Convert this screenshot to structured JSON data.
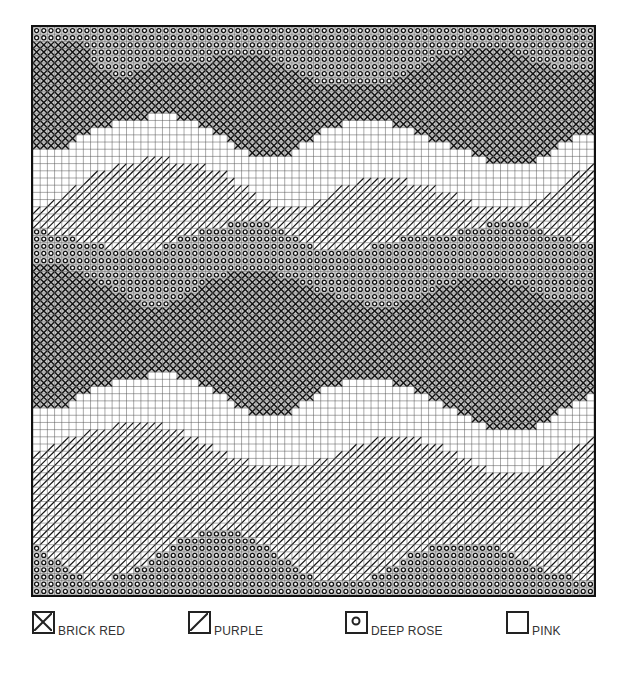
{
  "chart": {
    "cols": 78,
    "rows": 79,
    "symbols": {
      "brick_red": "cross",
      "purple": "slash",
      "deep_rose": "circle",
      "pink": "blank"
    },
    "bands": [
      {
        "color": "deep_rose",
        "from": "top"
      },
      {
        "color": "brick_red",
        "boundary": [
          [
            0,
            2
          ],
          [
            6,
            2
          ],
          [
            9,
            6
          ],
          [
            13,
            7
          ],
          [
            16,
            5
          ],
          [
            22,
            5
          ],
          [
            26,
            4
          ],
          [
            32,
            4
          ],
          [
            36,
            6
          ],
          [
            40,
            8
          ],
          [
            48,
            8
          ],
          [
            52,
            6
          ],
          [
            56,
            4
          ],
          [
            62,
            3
          ],
          [
            66,
            3
          ],
          [
            70,
            5
          ],
          [
            74,
            6
          ],
          [
            77,
            6
          ]
        ]
      },
      {
        "color": "pink",
        "boundary": [
          [
            0,
            17
          ],
          [
            4,
            17
          ],
          [
            6,
            15
          ],
          [
            9,
            14
          ],
          [
            12,
            13
          ],
          [
            18,
            12
          ],
          [
            22,
            13
          ],
          [
            26,
            15
          ],
          [
            30,
            18
          ],
          [
            34,
            18
          ],
          [
            36,
            17
          ],
          [
            40,
            14
          ],
          [
            44,
            13
          ],
          [
            48,
            13
          ],
          [
            52,
            14
          ],
          [
            56,
            16
          ],
          [
            60,
            17
          ],
          [
            64,
            19
          ],
          [
            68,
            19
          ],
          [
            72,
            17
          ],
          [
            75,
            15
          ],
          [
            77,
            15
          ]
        ]
      },
      {
        "color": "purple",
        "boundary": [
          [
            0,
            25
          ],
          [
            4,
            23
          ],
          [
            8,
            20
          ],
          [
            12,
            19
          ],
          [
            16,
            18
          ],
          [
            22,
            19
          ],
          [
            26,
            20
          ],
          [
            30,
            23
          ],
          [
            34,
            25
          ],
          [
            38,
            25
          ],
          [
            42,
            22
          ],
          [
            46,
            21
          ],
          [
            50,
            21
          ],
          [
            54,
            22
          ],
          [
            58,
            23
          ],
          [
            62,
            25
          ],
          [
            66,
            25
          ],
          [
            70,
            24
          ],
          [
            74,
            21
          ],
          [
            77,
            19
          ]
        ]
      },
      {
        "color": "deep_rose",
        "boundary": [
          [
            0,
            28
          ],
          [
            4,
            29
          ],
          [
            8,
            30
          ],
          [
            12,
            31
          ],
          [
            16,
            31
          ],
          [
            20,
            29
          ],
          [
            24,
            28
          ],
          [
            28,
            27
          ],
          [
            32,
            27
          ],
          [
            36,
            29
          ],
          [
            40,
            31
          ],
          [
            44,
            31
          ],
          [
            48,
            30
          ],
          [
            52,
            29
          ],
          [
            56,
            29
          ],
          [
            60,
            28
          ],
          [
            64,
            27
          ],
          [
            68,
            27
          ],
          [
            72,
            29
          ],
          [
            77,
            30
          ]
        ]
      },
      {
        "color": "brick_red",
        "boundary": [
          [
            0,
            33
          ],
          [
            4,
            33
          ],
          [
            8,
            35
          ],
          [
            12,
            37
          ],
          [
            16,
            39
          ],
          [
            20,
            38
          ],
          [
            24,
            35
          ],
          [
            28,
            34
          ],
          [
            32,
            34
          ],
          [
            36,
            35
          ],
          [
            40,
            37
          ],
          [
            44,
            38
          ],
          [
            48,
            39
          ],
          [
            52,
            38
          ],
          [
            56,
            36
          ],
          [
            60,
            35
          ],
          [
            64,
            35
          ],
          [
            68,
            36
          ],
          [
            72,
            38
          ],
          [
            77,
            38
          ]
        ]
      },
      {
        "color": "pink",
        "boundary": [
          [
            0,
            53
          ],
          [
            4,
            53
          ],
          [
            6,
            51
          ],
          [
            9,
            50
          ],
          [
            12,
            49
          ],
          [
            18,
            48
          ],
          [
            22,
            49
          ],
          [
            26,
            51
          ],
          [
            30,
            54
          ],
          [
            34,
            54
          ],
          [
            36,
            53
          ],
          [
            40,
            50
          ],
          [
            44,
            49
          ],
          [
            48,
            49
          ],
          [
            52,
            50
          ],
          [
            56,
            52
          ],
          [
            60,
            54
          ],
          [
            64,
            56
          ],
          [
            68,
            56
          ],
          [
            72,
            54
          ],
          [
            75,
            52
          ],
          [
            77,
            51
          ]
        ]
      },
      {
        "color": "purple",
        "boundary": [
          [
            0,
            59
          ],
          [
            4,
            57
          ],
          [
            8,
            56
          ],
          [
            12,
            55
          ],
          [
            16,
            55
          ],
          [
            20,
            56
          ],
          [
            24,
            58
          ],
          [
            28,
            60
          ],
          [
            32,
            61
          ],
          [
            36,
            61
          ],
          [
            40,
            60
          ],
          [
            44,
            58
          ],
          [
            48,
            57
          ],
          [
            52,
            57
          ],
          [
            56,
            58
          ],
          [
            60,
            60
          ],
          [
            64,
            62
          ],
          [
            68,
            62
          ],
          [
            72,
            60
          ],
          [
            75,
            58
          ],
          [
            77,
            57
          ]
        ]
      },
      {
        "color": "deep_rose",
        "boundary": [
          [
            0,
            72
          ],
          [
            4,
            75
          ],
          [
            8,
            77
          ],
          [
            12,
            76
          ],
          [
            16,
            74
          ],
          [
            20,
            71
          ],
          [
            24,
            70
          ],
          [
            28,
            70
          ],
          [
            32,
            72
          ],
          [
            36,
            75
          ],
          [
            40,
            77
          ],
          [
            44,
            77
          ],
          [
            48,
            76
          ],
          [
            52,
            73
          ],
          [
            56,
            72
          ],
          [
            60,
            72
          ],
          [
            64,
            72
          ],
          [
            68,
            74
          ],
          [
            72,
            76
          ],
          [
            77,
            77
          ]
        ]
      }
    ]
  },
  "legend": [
    {
      "symbol": "cross",
      "label": "BRICK RED"
    },
    {
      "symbol": "slash",
      "label": "PURPLE"
    },
    {
      "symbol": "circle",
      "label": "DEEP ROSE"
    },
    {
      "symbol": "blank",
      "label": "PINK"
    }
  ]
}
